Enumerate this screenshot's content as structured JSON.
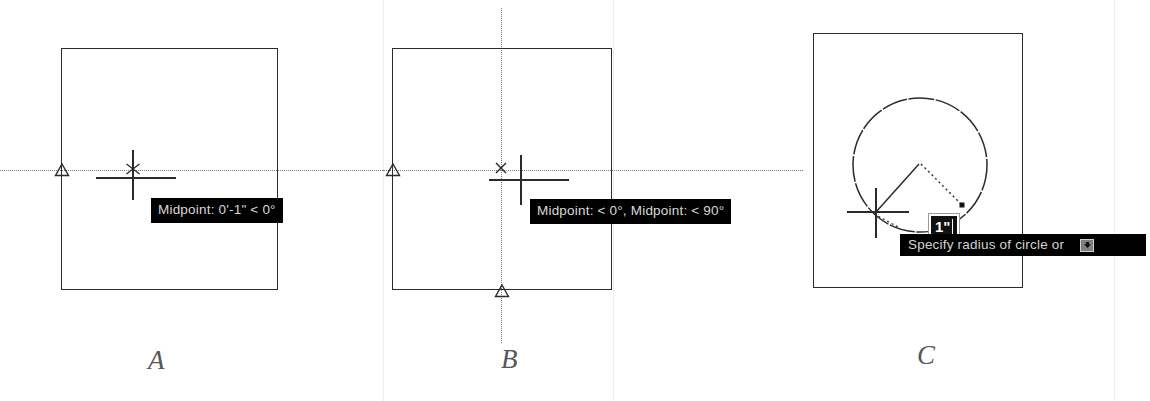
{
  "figure": {
    "caption_a": "A",
    "caption_b": "B",
    "caption_c": "C",
    "background_color": "#ffffff",
    "line_color": "#2b2b2b",
    "tracking_color": "#7d7d7d",
    "tooltip_bg": "#000000",
    "tooltip_fg": "#d8d8d8"
  },
  "panel_a": {
    "label": "A",
    "tooltip": "Midpoint: 0'-1\" < 0°",
    "snap_marker": "midpoint-triangle",
    "cursor": "crosshair",
    "tracking_lines": [
      "horizontal"
    ]
  },
  "panel_b": {
    "label": "B",
    "tooltip": "Midpoint: < 0°, Midpoint: < 90°",
    "snap_markers": [
      "midpoint-triangle-left",
      "midpoint-triangle-bottom"
    ],
    "cursor": "crosshair",
    "tracking_lines": [
      "horizontal",
      "vertical"
    ]
  },
  "panel_c": {
    "label": "C",
    "dimension_value": "1\"",
    "prompt_text": "Specify radius of circle or",
    "expand_icon": "down-arrow-icon",
    "cursor": "crosshair",
    "geometry": [
      "rectangle",
      "circle",
      "radius-line",
      "tracking-vector"
    ]
  }
}
